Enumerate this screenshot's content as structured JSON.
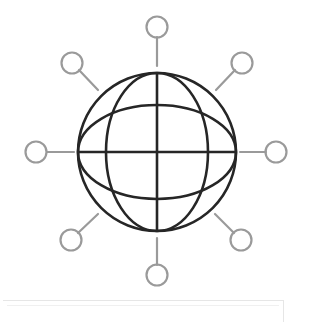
{
  "figure": {
    "colors": {
      "globe_stroke": "#262626",
      "node_stroke": "#9a9a9a",
      "background": "#ffffff",
      "box_border": "#e6e6e6"
    },
    "globe": {
      "cx": 157,
      "cy": 152,
      "r": 79,
      "meridian_ellipse": {
        "rx": 51,
        "ry": 79
      },
      "parallel_ellipse": {
        "rx": 79,
        "ry": 47
      }
    },
    "nodes": [
      {
        "name": "top",
        "cx": 157,
        "cy": 27,
        "line": [
          157,
          37,
          157,
          66
        ]
      },
      {
        "name": "top-right",
        "cx": 242,
        "cy": 63,
        "line": [
          235,
          70,
          216,
          90
        ]
      },
      {
        "name": "right",
        "cx": 276,
        "cy": 152,
        "line": [
          266,
          152,
          240,
          152
        ]
      },
      {
        "name": "bottom-right",
        "cx": 241,
        "cy": 240,
        "line": [
          234,
          233,
          215,
          214
        ]
      },
      {
        "name": "bottom",
        "cx": 157,
        "cy": 275,
        "line": [
          157,
          265,
          157,
          238
        ]
      },
      {
        "name": "bottom-left",
        "cx": 71,
        "cy": 240,
        "line": [
          78,
          233,
          98,
          214
        ]
      },
      {
        "name": "left",
        "cx": 36,
        "cy": 152,
        "line": [
          47,
          152,
          74,
          152
        ]
      },
      {
        "name": "top-left",
        "cx": 72,
        "cy": 63,
        "line": [
          79,
          70,
          98,
          90
        ]
      }
    ],
    "node_radius": 10.5,
    "caption": ""
  }
}
